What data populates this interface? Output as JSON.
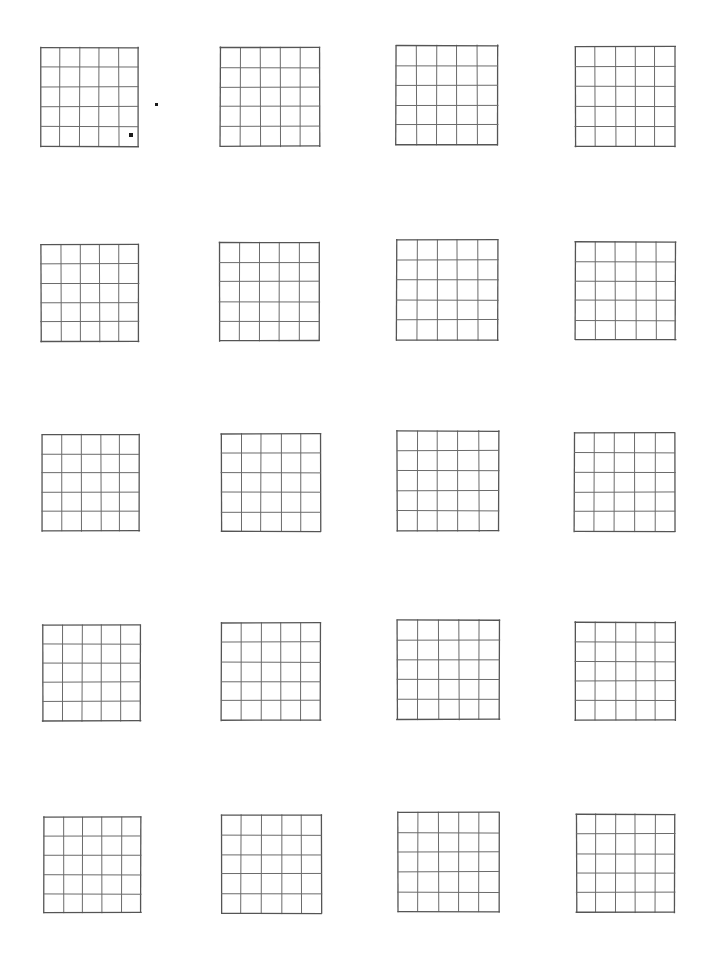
{
  "page": {
    "title": "Blank 5x5 Grid Worksheet",
    "background_color": "#ffffff",
    "width": 705,
    "height": 973
  },
  "style": {
    "line_color": "#6b6b6b",
    "outer_line_color": "#555555",
    "dot_color": "#1a1a1a",
    "line_width": 1,
    "outer_line_width": 1.3
  },
  "layout": {
    "columns": 4,
    "rows": 5,
    "total_grids": 20,
    "grid_rows": 5,
    "grid_cols": 5
  },
  "grids": [
    {
      "id": "grid-1",
      "row": 1,
      "col": 1,
      "x": 41,
      "y": 48,
      "width": 97,
      "height": 98,
      "rows": 5,
      "cols": 5,
      "label": "Grid 1"
    },
    {
      "id": "grid-2",
      "row": 1,
      "col": 2,
      "x": 220,
      "y": 48,
      "width": 100,
      "height": 98,
      "rows": 5,
      "cols": 5,
      "label": "Grid 2"
    },
    {
      "id": "grid-3",
      "row": 1,
      "col": 3,
      "x": 396,
      "y": 45,
      "width": 102,
      "height": 100,
      "rows": 5,
      "cols": 5,
      "label": "Grid 3"
    },
    {
      "id": "grid-4",
      "row": 1,
      "col": 4,
      "x": 575,
      "y": 47,
      "width": 100,
      "height": 99,
      "rows": 5,
      "cols": 5,
      "label": "Grid 4"
    },
    {
      "id": "grid-5",
      "row": 2,
      "col": 1,
      "x": 41,
      "y": 245,
      "width": 98,
      "height": 96,
      "rows": 5,
      "cols": 5,
      "label": "Grid 5"
    },
    {
      "id": "grid-6",
      "row": 2,
      "col": 2,
      "x": 220,
      "y": 243,
      "width": 99,
      "height": 98,
      "rows": 5,
      "cols": 5,
      "label": "Grid 6"
    },
    {
      "id": "grid-7",
      "row": 2,
      "col": 3,
      "x": 397,
      "y": 240,
      "width": 101,
      "height": 100,
      "rows": 5,
      "cols": 5,
      "label": "Grid 7"
    },
    {
      "id": "grid-8",
      "row": 2,
      "col": 4,
      "x": 575,
      "y": 242,
      "width": 100,
      "height": 98,
      "rows": 5,
      "cols": 5,
      "label": "Grid 8"
    },
    {
      "id": "grid-9",
      "row": 3,
      "col": 1,
      "x": 42,
      "y": 435,
      "width": 97,
      "height": 96,
      "rows": 5,
      "cols": 5,
      "label": "Grid 9"
    },
    {
      "id": "grid-10",
      "row": 3,
      "col": 2,
      "x": 221,
      "y": 434,
      "width": 99,
      "height": 97,
      "rows": 5,
      "cols": 5,
      "label": "Grid 10"
    },
    {
      "id": "grid-11",
      "row": 3,
      "col": 3,
      "x": 397,
      "y": 431,
      "width": 102,
      "height": 100,
      "rows": 5,
      "cols": 5,
      "label": "Grid 11"
    },
    {
      "id": "grid-12",
      "row": 3,
      "col": 4,
      "x": 575,
      "y": 433,
      "width": 100,
      "height": 98,
      "rows": 5,
      "cols": 5,
      "label": "Grid 12"
    },
    {
      "id": "grid-13",
      "row": 4,
      "col": 1,
      "x": 43,
      "y": 625,
      "width": 97,
      "height": 96,
      "rows": 5,
      "cols": 5,
      "label": "Grid 13"
    },
    {
      "id": "grid-14",
      "row": 4,
      "col": 2,
      "x": 221,
      "y": 623,
      "width": 99,
      "height": 97,
      "rows": 5,
      "cols": 5,
      "label": "Grid 14"
    },
    {
      "id": "grid-15",
      "row": 4,
      "col": 3,
      "x": 397,
      "y": 620,
      "width": 102,
      "height": 100,
      "rows": 5,
      "cols": 5,
      "label": "Grid 15"
    },
    {
      "id": "grid-16",
      "row": 4,
      "col": 4,
      "x": 575,
      "y": 622,
      "width": 100,
      "height": 98,
      "rows": 5,
      "cols": 5,
      "label": "Grid 16"
    },
    {
      "id": "grid-17",
      "row": 5,
      "col": 1,
      "x": 44,
      "y": 817,
      "width": 97,
      "height": 96,
      "rows": 5,
      "cols": 5,
      "label": "Grid 17"
    },
    {
      "id": "grid-18",
      "row": 5,
      "col": 2,
      "x": 222,
      "y": 815,
      "width": 99,
      "height": 98,
      "rows": 5,
      "cols": 5,
      "label": "Grid 18"
    },
    {
      "id": "grid-19",
      "row": 5,
      "col": 3,
      "x": 398,
      "y": 812,
      "width": 101,
      "height": 100,
      "rows": 5,
      "cols": 5,
      "label": "Grid 19"
    },
    {
      "id": "grid-20",
      "row": 5,
      "col": 4,
      "x": 576,
      "y": 814,
      "width": 99,
      "height": 98,
      "rows": 5,
      "cols": 5,
      "label": "Grid 20"
    }
  ],
  "marks": [
    {
      "id": "mark-1",
      "type": "dot",
      "x": 129,
      "y": 133,
      "size": 4,
      "label": "Dot inside bottom-right cell of grid 1"
    },
    {
      "id": "mark-2",
      "type": "dot",
      "x": 155,
      "y": 103,
      "size": 3,
      "label": "Isolated dot right of grid 1"
    }
  ]
}
